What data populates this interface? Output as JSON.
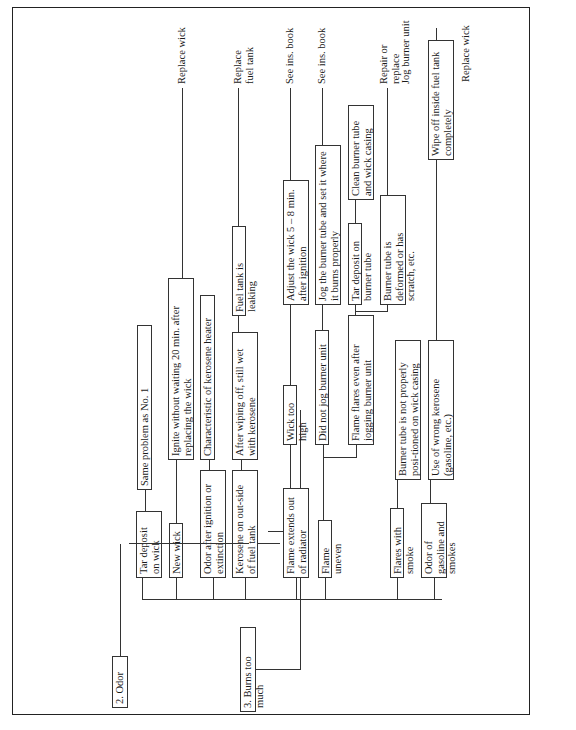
{
  "sections": [
    {
      "title": "2. Odor",
      "symptoms": [
        {
          "label": "Tar deposit on wick",
          "causes": [
            {
              "text": "Same problem as No. 1"
            }
          ]
        },
        {
          "label": "New wick",
          "causes": [
            {
              "text": "Ignite without waiting 20 min. after replacing the wick",
              "remedy": "Replace wick"
            }
          ]
        },
        {
          "label": "Odor after ignition or extinction",
          "causes": [
            {
              "text": "Characteristic of kerosene heater"
            }
          ]
        },
        {
          "label": "Kerosene on out-side of fuel tank",
          "causes": [
            {
              "text": "After wiping off, still wet with kerosene"
            },
            {
              "text": "Fuel tank is leaking",
              "remedy": "Replace fuel tank"
            }
          ]
        }
      ]
    },
    {
      "title": "3. Burns too much",
      "symptoms": [
        {
          "label": "Flame extends out of radiator",
          "causes": [
            {
              "text": "Wick too high"
            },
            {
              "text": "Adjust the wick 5 – 8 min. after ignition",
              "remedy": "See ins. book"
            }
          ]
        },
        {
          "label": "Flame uneven",
          "causes": [
            {
              "text": "Did not jog burner unit"
            },
            {
              "text": "Jog the burner tube and set it where it burns properly",
              "remedy": "See ins. book"
            },
            {
              "text": "Flame flares even after jogging burner unit"
            },
            {
              "text": "Tar deposit on burner tube"
            },
            {
              "text": "Clean burner tube and wick casing"
            },
            {
              "text": "Burner tube is deformed or has scratch, etc.",
              "remedy": "Repair or replace"
            }
          ]
        },
        {
          "label": "Flares with smoke",
          "causes": [
            {
              "text": "Burner tube is not properly posi-tioned on wick casing",
              "remedy": "Jog burner unit"
            }
          ]
        },
        {
          "label": "Odor of gasoline and smokes",
          "causes": [
            {
              "text": "Use of wrong kerosene (gasoline, etc.)"
            },
            {
              "text": "Wipe off inside fuel tank completely",
              "remedy": "Replace wick"
            }
          ]
        }
      ]
    }
  ],
  "remedies": {
    "replace_wick_1": "Replace wick",
    "replace_fuel_tank": "Replace fuel tank",
    "see_ins_book_1": "See ins. book",
    "see_ins_book_2": "See ins. book",
    "repair_or_replace": "Repair or replace",
    "jog_burner_unit": "Jog burner unit",
    "replace_wick_2": "Replace wick"
  }
}
